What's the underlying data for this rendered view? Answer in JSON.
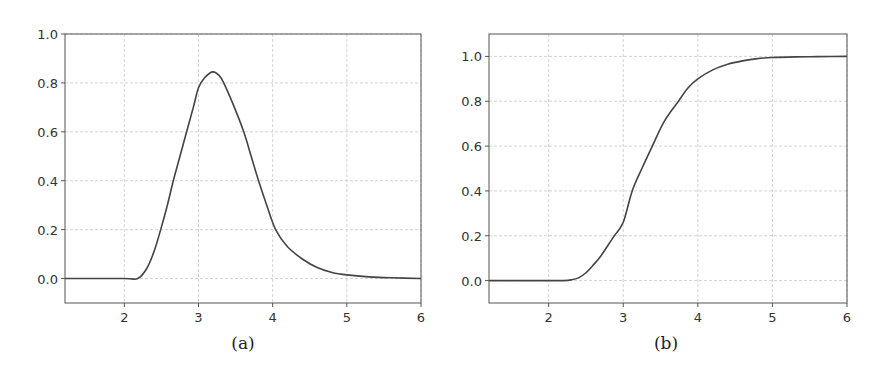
{
  "chart_data": [
    {
      "type": "line",
      "title": "",
      "caption": "(a)",
      "xlabel": "",
      "ylabel": "",
      "xlim": [
        1.2,
        6.0
      ],
      "ylim": [
        -0.1,
        1.0
      ],
      "xticks": [
        2,
        3,
        4,
        5,
        6
      ],
      "yticks": [
        0.0,
        0.2,
        0.4,
        0.6,
        0.8,
        1.0
      ],
      "xtick_labels": [
        "2",
        "3",
        "4",
        "5",
        "6"
      ],
      "ytick_labels": [
        "0.0",
        "0.2",
        "0.4",
        "0.6",
        "0.8",
        "1.0"
      ],
      "grid": true,
      "legend": null,
      "series": [
        {
          "name": "pdf",
          "color": "#444444",
          "x": [
            1.2,
            2.0,
            2.18,
            2.3,
            2.4,
            2.49,
            2.58,
            2.66,
            2.75,
            2.84,
            2.93,
            3.0,
            3.08,
            3.19,
            3.28,
            3.34,
            3.47,
            3.61,
            3.71,
            3.81,
            3.92,
            4.04,
            4.2,
            4.4,
            4.6,
            4.8,
            5.0,
            5.3,
            5.6,
            6.0
          ],
          "y": [
            0.0,
            0.0,
            0.0,
            0.04,
            0.11,
            0.2,
            0.3,
            0.4,
            0.5,
            0.6,
            0.7,
            0.78,
            0.82,
            0.845,
            0.83,
            0.8,
            0.71,
            0.6,
            0.5,
            0.4,
            0.3,
            0.2,
            0.13,
            0.08,
            0.045,
            0.025,
            0.015,
            0.007,
            0.003,
            0.0
          ]
        }
      ]
    },
    {
      "type": "line",
      "title": "",
      "caption": "(b)",
      "xlabel": "",
      "ylabel": "",
      "xlim": [
        1.2,
        6.0
      ],
      "ylim": [
        -0.1,
        1.1
      ],
      "xticks": [
        2,
        3,
        4,
        5,
        6
      ],
      "yticks": [
        0.0,
        0.2,
        0.4,
        0.6,
        0.8,
        1.0
      ],
      "xtick_labels": [
        "2",
        "3",
        "4",
        "5",
        "6"
      ],
      "ytick_labels": [
        "0.0",
        "0.2",
        "0.4",
        "0.6",
        "0.8",
        "1.0"
      ],
      "grid": true,
      "legend": null,
      "series": [
        {
          "name": "cdf",
          "color": "#444444",
          "x": [
            1.2,
            2.0,
            2.2,
            2.3,
            2.4,
            2.5,
            2.6,
            2.7,
            2.8,
            2.88,
            3.0,
            3.12,
            3.25,
            3.39,
            3.55,
            3.74,
            3.87,
            4.0,
            4.2,
            4.4,
            4.6,
            4.8,
            5.0,
            5.3,
            5.6,
            6.0
          ],
          "y": [
            0.0,
            0.0,
            0.0,
            0.003,
            0.012,
            0.035,
            0.07,
            0.11,
            0.16,
            0.2,
            0.26,
            0.4,
            0.5,
            0.6,
            0.71,
            0.8,
            0.86,
            0.9,
            0.94,
            0.965,
            0.98,
            0.99,
            0.995,
            0.998,
            0.999,
            1.0
          ]
        }
      ]
    }
  ],
  "captions": {
    "a": "(a)",
    "b": "(b)"
  }
}
